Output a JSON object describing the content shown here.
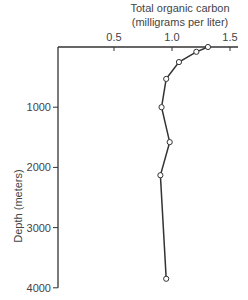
{
  "chart_data": {
    "type": "line",
    "title": "Total organic carbon",
    "subtitle": "(milligrams per liter)",
    "xlabel": "Total organic carbon (milligrams per liter)",
    "ylabel": "Depth (meters)",
    "x_axis_position": "top",
    "y_axis_inverted": true,
    "xlim": [
      0.0,
      1.55
    ],
    "ylim": [
      0,
      4000
    ],
    "x_ticks": [
      0.5,
      1.0,
      1.5
    ],
    "x_tick_labels": [
      "0.5",
      "1.0",
      "1.5"
    ],
    "y_ticks": [
      1000,
      2000,
      3000,
      4000
    ],
    "y_tick_labels": [
      "1000",
      "2000",
      "3000",
      "4000"
    ],
    "grid": false,
    "legend": null,
    "series": [
      {
        "name": "Total organic carbon",
        "marker": "open-circle",
        "x": [
          1.31,
          1.21,
          1.06,
          0.95,
          0.91,
          0.98,
          0.9,
          0.95
        ],
        "y": [
          0,
          80,
          250,
          530,
          1000,
          1580,
          2130,
          3850
        ]
      }
    ]
  }
}
